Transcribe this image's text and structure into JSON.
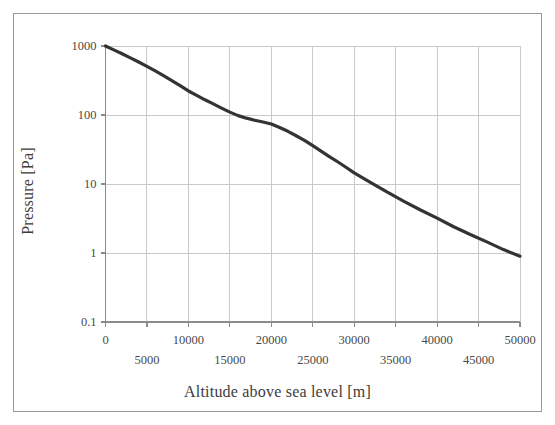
{
  "chart_data": {
    "type": "line",
    "title": "",
    "xlabel": "Altitude above sea level [m]",
    "ylabel": "Pressure [Pa]",
    "yscale": "log",
    "xscale": "linear",
    "xlim": [
      0,
      50000
    ],
    "ylim": [
      0.1,
      1000
    ],
    "grid": true,
    "legend": false,
    "xticks": [
      0,
      5000,
      10000,
      15000,
      20000,
      25000,
      30000,
      35000,
      40000,
      45000,
      50000
    ],
    "xtick_labels": [
      "0",
      "5000",
      "10000",
      "15000",
      "20000",
      "25000",
      "30000",
      "35000",
      "40000",
      "45000",
      "50000"
    ],
    "xtick_rows": [
      0,
      1,
      0,
      1,
      0,
      1,
      0,
      1,
      0,
      1,
      0
    ],
    "yticks": [
      0.1,
      1,
      10,
      100,
      1000
    ],
    "ytick_labels": [
      "0.1",
      "1",
      "10",
      "100",
      "1000"
    ],
    "series": [
      {
        "name": "pressure",
        "color": "#333333",
        "linewidth": 3.2,
        "x": [
          0,
          1000,
          2000,
          3000,
          4000,
          5000,
          6000,
          7000,
          8000,
          9000,
          10000,
          11000,
          12000,
          13000,
          14000,
          15000,
          16000,
          17000,
          18000,
          19000,
          20000,
          21000,
          22000,
          23000,
          24000,
          25000,
          26000,
          27000,
          28000,
          29000,
          30000,
          32000,
          34000,
          36000,
          38000,
          40000,
          42000,
          44000,
          46000,
          48000,
          50000
        ],
        "y": [
          1000,
          880,
          772,
          674,
          586,
          507,
          436,
          372,
          316,
          266,
          223,
          192,
          166,
          145,
          126,
          110,
          98,
          90,
          84,
          79,
          74,
          66,
          58,
          50,
          43,
          36,
          30,
          25,
          21,
          17.5,
          14.5,
          10.5,
          7.6,
          5.6,
          4.2,
          3.2,
          2.4,
          1.85,
          1.45,
          1.12,
          0.9
        ]
      }
    ]
  },
  "axes": {
    "y_title": "Pressure [Pa]",
    "x_title": "Altitude above sea level [m]"
  },
  "style": {
    "grid_color": "#c9c9c9",
    "axis_color": "#8c8c8c",
    "curve_color": "#333333",
    "text_color": "#4a4a4a",
    "frame_color": "#9a9a9a",
    "background": "#ffffff"
  }
}
